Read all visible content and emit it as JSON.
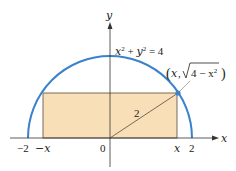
{
  "diagram": {
    "type": "semicircle-inscribed-rectangle",
    "colors": {
      "circle": "#3b82c9",
      "rectangle_fill": "#f8dfb8",
      "rectangle_stroke": "#5a4a3a",
      "axis": "#333333",
      "point": "#3b82c9"
    },
    "axes": {
      "x_label": "x",
      "y_label": "y"
    },
    "equation": {
      "lhs_x": "x",
      "exp1": "2",
      "plus": " + ",
      "lhs_y": "y",
      "exp2": "2",
      "rhs": " = 4"
    },
    "point_label": {
      "open": "(",
      "x": "x",
      "comma": ",",
      "radicand": "4 − x",
      "exp": "2",
      "close": ")"
    },
    "radius_label": "2",
    "tick_labels": {
      "neg_two": "−2",
      "neg_x": "−x",
      "origin": "0",
      "x": "x",
      "two": "2"
    }
  }
}
